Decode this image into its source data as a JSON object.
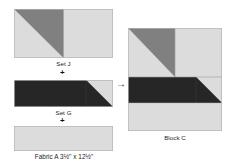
{
  "diagram": {
    "palette": {
      "light": "#dcdcdc",
      "medium": "#808080",
      "dark": "#262626",
      "outline": "#b4b4b4",
      "text": "#1b1b1b"
    },
    "operators": {
      "plus": "+",
      "arrow": "→"
    },
    "units": [
      {
        "id": "setJ",
        "label": "Set J",
        "icon": "half-square-triangle-pair",
        "patches": [
          {
            "name": "triangle-light-lower-left",
            "color": "#dcdcdc"
          },
          {
            "name": "triangle-medium-upper-right",
            "color": "#808080"
          },
          {
            "name": "square-light-right",
            "color": "#dcdcdc"
          }
        ]
      },
      {
        "id": "setG",
        "label": "Set G",
        "icon": "dark-rectangle-with-light-corner-triangle",
        "patches": [
          {
            "name": "rectangle-dark",
            "color": "#262626"
          },
          {
            "name": "triangle-light-upper-right",
            "color": "#dcdcdc"
          }
        ]
      },
      {
        "id": "fabricA",
        "label": "Fabric A 3½\" x 12½\"",
        "icon": "plain-light-rectangle",
        "patches": [
          {
            "name": "rectangle-light",
            "color": "#dcdcdc"
          }
        ]
      },
      {
        "id": "blockC",
        "label": "Block C",
        "icon": "assembled-quilt-block",
        "patches": [
          {
            "name": "triangle-light-lower-left",
            "color": "#dcdcdc"
          },
          {
            "name": "triangle-medium-upper-right",
            "color": "#808080"
          },
          {
            "name": "square-light-top-right",
            "color": "#dcdcdc"
          },
          {
            "name": "rectangle-dark-middle",
            "color": "#262626"
          },
          {
            "name": "triangle-light-middle-right",
            "color": "#dcdcdc"
          },
          {
            "name": "rectangle-light-bottom",
            "color": "#dcdcdc"
          }
        ]
      }
    ]
  }
}
